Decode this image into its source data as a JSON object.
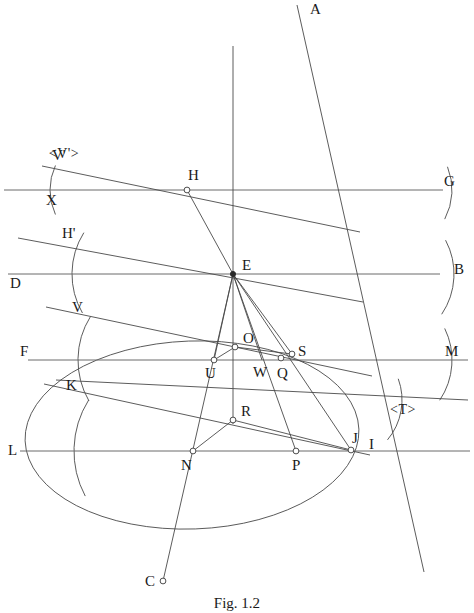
{
  "figure": {
    "caption": "Fig. 1.2",
    "background_color": "#ffffff",
    "ink_color": "#3a3a3a",
    "width": 474,
    "height": 613
  },
  "chart_data": {
    "type": "diagram",
    "title": "Fig. 1.2",
    "subtype": "geometric-construction",
    "horizontal_lines": [
      {
        "name": "XG",
        "y": 190,
        "x1": 4,
        "x2": 443,
        "left_label": "X",
        "right_label": "G"
      },
      {
        "name": "DB",
        "y": 274,
        "x1": 8,
        "x2": 440,
        "left_label": "D",
        "right_label": "B"
      },
      {
        "name": "FM",
        "y": 360,
        "x1": 28,
        "x2": 468,
        "left_label": "F",
        "right_label": "M"
      },
      {
        "name": "LI",
        "y": 451,
        "x1": 20,
        "x2": 470,
        "left_label": "L",
        "right_label": "I"
      }
    ],
    "points": [
      {
        "label": "A",
        "x": 310,
        "y": 12,
        "marker": "none",
        "lx": 310,
        "ly": 14
      },
      {
        "label": "H",
        "x": 187,
        "y": 190,
        "marker": "open",
        "lx": 188,
        "ly": 180
      },
      {
        "label": "E",
        "x": 233,
        "y": 274,
        "marker": "solid",
        "lx": 242,
        "ly": 270
      },
      {
        "label": "O",
        "x": 235,
        "y": 347,
        "marker": "open",
        "lx": 243,
        "ly": 343
      },
      {
        "label": "U",
        "x": 214,
        "y": 360,
        "marker": "open",
        "lx": 205,
        "ly": 378
      },
      {
        "label": "W",
        "x": 262,
        "y": 360,
        "marker": "none",
        "lx": 253,
        "ly": 377
      },
      {
        "label": "Q",
        "x": 281,
        "y": 358,
        "marker": "open",
        "lx": 277,
        "ly": 378
      },
      {
        "label": "S",
        "x": 292,
        "y": 354,
        "marker": "open",
        "lx": 298,
        "ly": 356
      },
      {
        "label": "R",
        "x": 233,
        "y": 420,
        "marker": "open",
        "lx": 241,
        "ly": 416
      },
      {
        "label": "N",
        "x": 193,
        "y": 451,
        "marker": "open",
        "lx": 181,
        "ly": 470
      },
      {
        "label": "P",
        "x": 296,
        "y": 451,
        "marker": "open",
        "lx": 292,
        "ly": 470
      },
      {
        "label": "J",
        "x": 351,
        "y": 450,
        "marker": "open",
        "lx": 352,
        "ly": 443
      },
      {
        "label": "C",
        "x": 163,
        "y": 581,
        "marker": "open",
        "lx": 145,
        "ly": 586
      },
      {
        "label": "I",
        "x": 371,
        "y": 447,
        "marker": "none",
        "lx": 369,
        "ly": 449
      },
      {
        "label": "V'",
        "x": 60,
        "y": 175,
        "marker": "none",
        "lx": 52,
        "ly": 160
      },
      {
        "label": "H'",
        "x": 74,
        "y": 240,
        "marker": "none",
        "lx": 62,
        "ly": 238
      },
      {
        "label": "V",
        "x": 82,
        "y": 316,
        "marker": "none",
        "lx": 72,
        "ly": 312
      },
      {
        "label": "K",
        "x": 78,
        "y": 393,
        "marker": "none",
        "lx": 66,
        "ly": 390
      },
      {
        "label": "G",
        "x": 452,
        "y": 186,
        "marker": "none",
        "lx": 444,
        "ly": 186
      },
      {
        "label": "B",
        "x": 461,
        "y": 274,
        "marker": "none",
        "lx": 454,
        "ly": 274
      },
      {
        "label": "M",
        "x": 452,
        "y": 356,
        "marker": "none",
        "lx": 445,
        "ly": 356
      },
      {
        "label": "L",
        "x": 12,
        "y": 455,
        "marker": "none",
        "lx": 8,
        "ly": 455
      },
      {
        "label": "F",
        "x": 24,
        "y": 356,
        "marker": "none",
        "lx": 20,
        "ly": 356
      },
      {
        "label": "D",
        "x": 14,
        "y": 288,
        "marker": "none",
        "lx": 10,
        "ly": 288
      },
      {
        "label": "X",
        "x": 52,
        "y": 205,
        "marker": "none",
        "lx": 46,
        "ly": 205
      }
    ],
    "angle_tags": [
      {
        "label": "<V'>",
        "x": 64,
        "y": 158
      },
      {
        "label": "<T>",
        "x": 403,
        "y": 414
      }
    ],
    "segments": [
      {
        "name": "ray-A-through-E-to-J-I",
        "x1": 297,
        "y1": 5,
        "x2": 424,
        "y2": 572
      },
      {
        "name": "vertical-axis",
        "x1": 233,
        "y1": 46,
        "x2": 233,
        "y2": 424
      },
      {
        "name": "line-H-to-E",
        "x1": 187,
        "y1": 190,
        "x2": 233,
        "y2": 274
      },
      {
        "name": "line-E-to-U",
        "x1": 233,
        "y1": 274,
        "x2": 214,
        "y2": 360
      },
      {
        "name": "line-E-to-N-to-C",
        "x1": 233,
        "y1": 274,
        "x2": 163,
        "y2": 581
      },
      {
        "name": "line-E-to-W",
        "x1": 233,
        "y1": 274,
        "x2": 262,
        "y2": 360
      },
      {
        "name": "line-E-to-Q-to-P",
        "x1": 233,
        "y1": 274,
        "x2": 296,
        "y2": 451
      },
      {
        "name": "line-E-to-S",
        "x1": 233,
        "y1": 274,
        "x2": 292,
        "y2": 354
      },
      {
        "name": "line-E-to-J",
        "x1": 233,
        "y1": 274,
        "x2": 351,
        "y2": 450
      },
      {
        "name": "line-U-to-O",
        "x1": 214,
        "y1": 360,
        "x2": 235,
        "y2": 347
      },
      {
        "name": "line-O-to-S",
        "x1": 235,
        "y1": 347,
        "x2": 292,
        "y2": 354
      },
      {
        "name": "line-N-to-R",
        "x1": 193,
        "y1": 451,
        "x2": 233,
        "y2": 420
      },
      {
        "name": "line-R-to-J",
        "x1": 233,
        "y1": 420,
        "x2": 351,
        "y2": 450
      },
      {
        "name": "oblique-V-prime-top",
        "x1": 42,
        "y1": 166,
        "x2": 360,
        "y2": 232
      },
      {
        "name": "oblique-H-prime",
        "x1": 18,
        "y1": 238,
        "x2": 363,
        "y2": 302
      },
      {
        "name": "oblique-V",
        "x1": 46,
        "y1": 307,
        "x2": 372,
        "y2": 376
      },
      {
        "name": "oblique-K",
        "x1": 44,
        "y1": 384,
        "x2": 370,
        "y2": 455
      },
      {
        "name": "oblique-T-lower",
        "x1": 56,
        "y1": 380,
        "x2": 468,
        "y2": 400
      }
    ],
    "arcs": [
      {
        "name": "arc-X-left",
        "cx": 108,
        "cy": 190,
        "r": 58,
        "a1": 155,
        "a2": 205
      },
      {
        "name": "arc-G-right",
        "cx": 390,
        "cy": 190,
        "r": 62,
        "a1": -22,
        "a2": 28
      },
      {
        "name": "arc-H-prime",
        "cx": 150,
        "cy": 274,
        "r": 78,
        "a1": 150,
        "a2": 212
      },
      {
        "name": "arc-B-right",
        "cx": 382,
        "cy": 274,
        "r": 72,
        "a1": -28,
        "a2": 34
      },
      {
        "name": "arc-V-left",
        "cx": 160,
        "cy": 360,
        "r": 82,
        "a1": 150,
        "a2": 212
      },
      {
        "name": "arc-M-right",
        "cx": 380,
        "cy": 360,
        "r": 72,
        "a1": -26,
        "a2": 34
      },
      {
        "name": "arc-K-left",
        "cx": 170,
        "cy": 451,
        "r": 96,
        "a1": 152,
        "a2": 212
      },
      {
        "name": "arc-T-right",
        "cx": 340,
        "cy": 400,
        "r": 62,
        "a1": -20,
        "a2": 40
      }
    ],
    "ellipse": {
      "name": "major-circle",
      "cx": 192,
      "cy": 435,
      "rx": 167,
      "ry": 94,
      "rotation": -2
    }
  },
  "labels": {
    "figure_caption": "Fig. 1.2"
  }
}
